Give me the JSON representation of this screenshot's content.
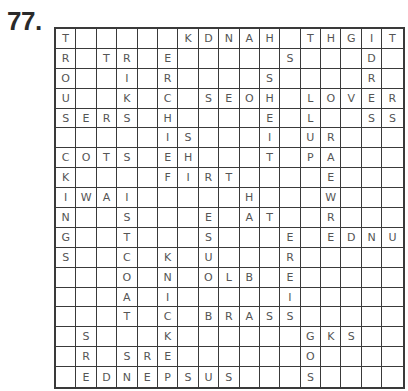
{
  "puzzle": {
    "number": "77.",
    "cols": 17,
    "rows": [
      "T     KDNAH THGIT ",
      "R TR E     S   D ",
      "O  I R    S    R ",
      "U  K C SEOH LOVER",
      "SERS H    E L  SS",
      "     IS   I UR   ",
      "COTS EH   T PA   ",
      "K    FIRT    E   ",
      "IWAI     H   W   ",
      "N  S   E AT  R   ",
      "G  T   S   E EDNU",
      "S  C K U   R     ",
      "   O N OLB E     ",
      "   A I     I     ",
      "   T C BRASS     ",
      " S   K      GKS  ",
      " R SRE      O    ",
      " EDNEPSUS   S    "
    ]
  }
}
